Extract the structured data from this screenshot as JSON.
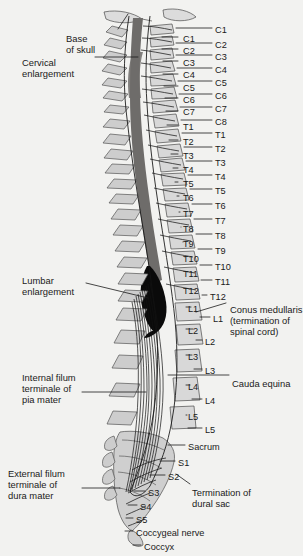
{
  "figure": {
    "background_color": "#f2f2f0",
    "ink_color": "#1a1a1a",
    "cord_color": "#6e6c6a",
    "enlargement_color": "#0a0a0a",
    "bone_color": "#d8d8d8"
  },
  "left_labels": [
    {
      "id": "base-of-skull",
      "lines": [
        "Base",
        "of skull"
      ],
      "x": 66,
      "y": 33
    },
    {
      "id": "cervical-enlargement",
      "lines": [
        "Cervical",
        "enlargement"
      ],
      "x": 22,
      "y": 57
    },
    {
      "id": "lumbar-enlargement",
      "lines": [
        "Lumbar",
        "enlargement"
      ],
      "x": 22,
      "y": 275
    },
    {
      "id": "internal-filum-terminale",
      "lines": [
        "Internal filum",
        "terminale of",
        "pia mater"
      ],
      "x": 22,
      "y": 372
    },
    {
      "id": "external-filum-terminale",
      "lines": [
        "External filum",
        "terminale of",
        "dura mater"
      ],
      "x": 8,
      "y": 468
    }
  ],
  "right_notes": [
    {
      "id": "conus-medullaris",
      "lines": [
        "Conus medullaris",
        "(termination of",
        "spinal cord)"
      ],
      "x": 230,
      "y": 304
    },
    {
      "id": "cauda-equina",
      "lines": [
        "Cauda equina"
      ],
      "x": 232,
      "y": 378
    },
    {
      "id": "termination-dural-sac",
      "lines": [
        "Termination of",
        "dural sac"
      ],
      "x": 192,
      "y": 487
    }
  ],
  "vertebrae_labels": [
    {
      "text": "C1",
      "x": 183,
      "y": 40
    },
    {
      "text": "C2",
      "x": 183,
      "y": 52
    },
    {
      "text": "C3",
      "x": 183,
      "y": 64
    },
    {
      "text": "C4",
      "x": 183,
      "y": 76
    },
    {
      "text": "C5",
      "x": 183,
      "y": 89
    },
    {
      "text": "C6",
      "x": 183,
      "y": 101
    },
    {
      "text": "C7",
      "x": 183,
      "y": 113
    },
    {
      "text": "T1",
      "x": 183,
      "y": 128
    },
    {
      "text": "T2",
      "x": 183,
      "y": 143
    },
    {
      "text": "T3",
      "x": 183,
      "y": 157
    },
    {
      "text": "T4",
      "x": 183,
      "y": 171
    },
    {
      "text": "T5",
      "x": 183,
      "y": 185
    },
    {
      "text": "T6",
      "x": 183,
      "y": 199
    },
    {
      "text": "T7",
      "x": 183,
      "y": 215
    },
    {
      "text": "T8",
      "x": 183,
      "y": 230
    },
    {
      "text": "T9",
      "x": 183,
      "y": 245
    },
    {
      "text": "T10",
      "x": 183,
      "y": 260
    },
    {
      "text": "T11",
      "x": 183,
      "y": 275
    },
    {
      "text": "T12",
      "x": 183,
      "y": 292
    },
    {
      "text": "L1",
      "x": 188,
      "y": 310
    },
    {
      "text": "L2",
      "x": 188,
      "y": 332
    },
    {
      "text": "L3",
      "x": 188,
      "y": 358
    },
    {
      "text": "L4",
      "x": 188,
      "y": 388
    },
    {
      "text": "L5",
      "x": 188,
      "y": 418
    }
  ],
  "nerve_labels": [
    {
      "text": "C1",
      "x": 215,
      "y": 31
    },
    {
      "text": "C2",
      "x": 215,
      "y": 46
    },
    {
      "text": "C3",
      "x": 215,
      "y": 58
    },
    {
      "text": "C4",
      "x": 215,
      "y": 71
    },
    {
      "text": "C5",
      "x": 215,
      "y": 84
    },
    {
      "text": "C6",
      "x": 215,
      "y": 97
    },
    {
      "text": "C7",
      "x": 215,
      "y": 110
    },
    {
      "text": "C8",
      "x": 215,
      "y": 123
    },
    {
      "text": "T1",
      "x": 215,
      "y": 136
    },
    {
      "text": "T2",
      "x": 215,
      "y": 150
    },
    {
      "text": "T3",
      "x": 215,
      "y": 164
    },
    {
      "text": "T4",
      "x": 215,
      "y": 178
    },
    {
      "text": "T5",
      "x": 215,
      "y": 192
    },
    {
      "text": "T6",
      "x": 215,
      "y": 207
    },
    {
      "text": "T7",
      "x": 215,
      "y": 222
    },
    {
      "text": "T8",
      "x": 215,
      "y": 237
    },
    {
      "text": "T9",
      "x": 215,
      "y": 252
    },
    {
      "text": "T10",
      "x": 215,
      "y": 268
    },
    {
      "text": "T11",
      "x": 215,
      "y": 283
    },
    {
      "text": "T12",
      "x": 210,
      "y": 298
    },
    {
      "text": "L1",
      "x": 213,
      "y": 320
    },
    {
      "text": "L2",
      "x": 205,
      "y": 343
    },
    {
      "text": "L3",
      "x": 205,
      "y": 372
    },
    {
      "text": "L4",
      "x": 205,
      "y": 402
    },
    {
      "text": "L5",
      "x": 205,
      "y": 431
    },
    {
      "text": "Sacrum",
      "x": 188,
      "y": 448
    },
    {
      "text": "S1",
      "x": 178,
      "y": 464
    },
    {
      "text": "S2",
      "x": 168,
      "y": 478
    },
    {
      "text": "S3",
      "x": 148,
      "y": 494
    },
    {
      "text": "S4",
      "x": 140,
      "y": 508
    },
    {
      "text": "S5",
      "x": 136,
      "y": 521
    },
    {
      "text": "Coccygeal nerve",
      "x": 136,
      "y": 534
    },
    {
      "text": "Coccyx",
      "x": 144,
      "y": 548
    }
  ]
}
